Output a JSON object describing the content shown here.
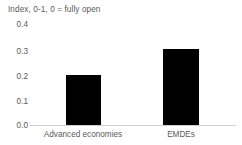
{
  "chart_data": {
    "type": "bar",
    "title": "Index, 0-1, 0 = fully open",
    "xlabel": "",
    "ylabel": "",
    "categories": [
      "Advanced economies",
      "EMDEs"
    ],
    "values": [
      0.2,
      0.3
    ],
    "ylim": [
      0.0,
      0.4
    ],
    "yticks": [
      "0.0",
      "0.1",
      "0.2",
      "0.3",
      "0.4"
    ],
    "ytick_values": [
      0.0,
      0.1,
      0.2,
      0.3,
      0.4
    ],
    "grid": false,
    "legend": null,
    "legend_position": "none",
    "series": [
      {
        "name": "Index, 0-1, 0 = fully open",
        "values": [
          0.2,
          0.3
        ],
        "color": "#000000"
      }
    ],
    "annotations": []
  },
  "style": {
    "background": "#ffffff",
    "bar_color": "#000000",
    "text_color": "#5a5a5a",
    "axis_color": "#d0d0d0"
  }
}
